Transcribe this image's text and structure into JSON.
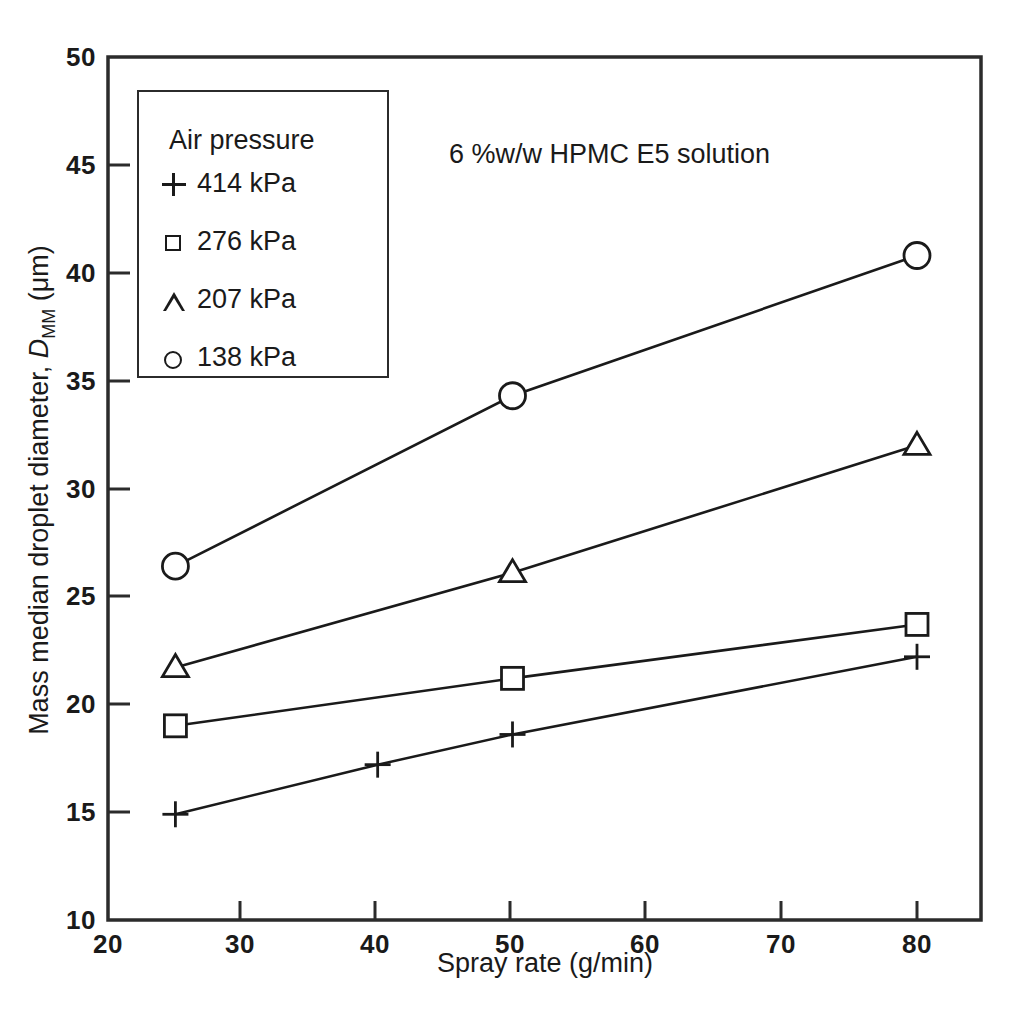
{
  "chart_data": {
    "type": "line",
    "title": "",
    "annotation": "6 %w/w HPMC E5 solution",
    "xlabel": "Spray rate (g/min)",
    "ylabel_prefix": "Mass median droplet diameter, ",
    "ylabel_symbol": "D",
    "ylabel_subscript": "MM",
    "ylabel_units": " (μm)",
    "xlim": [
      20,
      80
    ],
    "ylim": [
      10,
      50
    ],
    "xticks": [
      20,
      30,
      40,
      50,
      60,
      70,
      80
    ],
    "yticks": [
      10,
      15,
      20,
      25,
      30,
      35,
      40,
      45,
      50
    ],
    "xtick_labels": [
      "20",
      "30",
      "40",
      "50",
      "60",
      "70",
      "80"
    ],
    "ytick_labels": [
      "10",
      "15",
      "20",
      "25",
      "30",
      "35",
      "40",
      "45",
      "50"
    ],
    "grid": false,
    "legend_position": "upper-left-inset",
    "legend_title": "Air pressure",
    "series": [
      {
        "name": "414 kPa",
        "marker": "plus",
        "x": [
          25,
          40,
          50,
          80
        ],
        "y": [
          14.9,
          17.2,
          18.6,
          22.2
        ]
      },
      {
        "name": "276 kPa",
        "marker": "square",
        "x": [
          25,
          50,
          80
        ],
        "y": [
          19.0,
          21.2,
          23.7
        ]
      },
      {
        "name": "207 kPa",
        "marker": "triangle",
        "x": [
          25,
          50,
          80
        ],
        "y": [
          21.7,
          26.1,
          32.0
        ]
      },
      {
        "name": "138 kPa",
        "marker": "circle",
        "x": [
          25,
          50,
          80
        ],
        "y": [
          26.4,
          34.3,
          40.8
        ]
      }
    ]
  },
  "legend": {
    "title": "Air pressure",
    "entries": [
      {
        "marker": "plus-marker",
        "label": "414 kPa"
      },
      {
        "marker": "square-marker",
        "label": "276 kPa"
      },
      {
        "marker": "triangle-marker",
        "label": "207 kPa"
      },
      {
        "marker": "circle-marker",
        "label": "138 kPa"
      }
    ]
  },
  "colors": {
    "ink": "#1a1a1a",
    "background": "#ffffff"
  }
}
